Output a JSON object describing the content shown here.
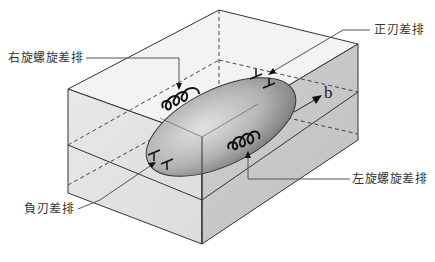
{
  "diagram": {
    "type": "dislocation-loop-in-crystal-block",
    "labels": {
      "right_screw": "右旋螺旋差排",
      "positive_edge": "正刃差排",
      "negative_edge": "負刃差排",
      "left_screw": "左旋螺旋差排",
      "burgers_vector": "b"
    },
    "colors": {
      "top_face": "#f2f2f2",
      "left_face": "#e6e6e6",
      "right_face": "#c9c9c9",
      "loop_fill_light": "#d8d8d8",
      "loop_fill_dark": "#8a8a8a",
      "edge_line": "#333333",
      "leader_line": "#666666"
    }
  }
}
